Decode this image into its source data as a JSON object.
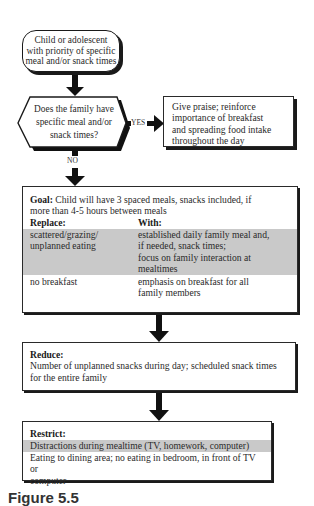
{
  "start": {
    "lines": [
      "Child or adolescent",
      "with priority of specific",
      "meal and/or snack times"
    ]
  },
  "decision": {
    "lines": [
      "Does the family have",
      "specific meal and/or",
      "snack times?"
    ],
    "yes_label": "YES",
    "no_label": "NO"
  },
  "praise": {
    "lines": [
      "Give praise; reinforce",
      "importance of breakfast",
      "and spreading food intake",
      "throughout the day"
    ]
  },
  "goal": {
    "heading": "Goal:",
    "text_line1": " Child will have 3 spaced meals, snacks included, if",
    "text_line2": "more than 4-5 hours between meals",
    "replace_header": "Replace:",
    "with_header": "With:",
    "rows": [
      {
        "replace": [
          "scattered/grazing/",
          "unplanned eating"
        ],
        "with": [
          "established daily family meal and,",
          "if needed, snack times;",
          "focus on family interaction at",
          "mealtimes"
        ],
        "shaded": true
      },
      {
        "replace": [
          "no breakfast"
        ],
        "with": [
          "emphasis on breakfast for all",
          "family members"
        ],
        "shaded": false
      }
    ]
  },
  "reduce": {
    "heading": "Reduce:",
    "lines": [
      "Number of unplanned snacks during day; scheduled snack times",
      "for the entire family"
    ]
  },
  "restrict": {
    "heading": "Restrict:",
    "shaded_line": "Distractions during mealtime (TV, homework, computer)",
    "lines": [
      "Eating to dining area; no eating in bedroom, in front of TV or",
      "computer"
    ]
  },
  "caption": {
    "text": "Figure 5.5"
  }
}
